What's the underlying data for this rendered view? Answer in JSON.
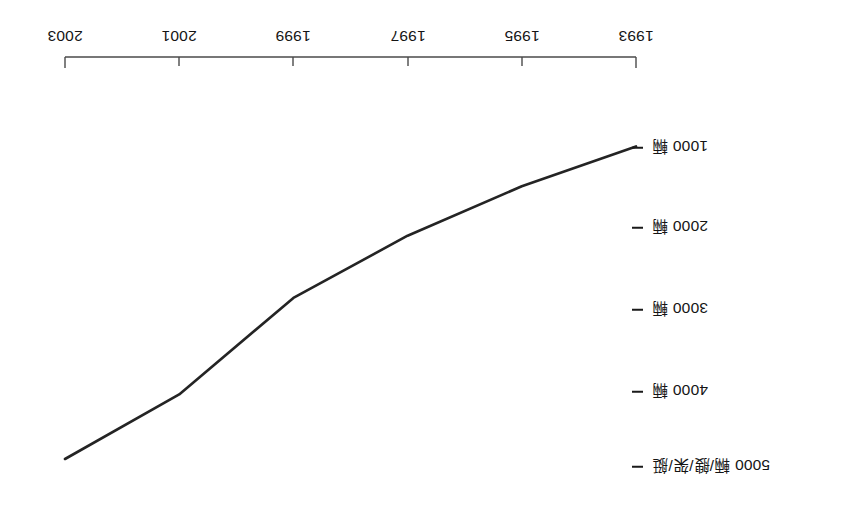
{
  "figure": {
    "orientation_note": "180",
    "line_color": "#242424",
    "axis_color": "#4a4a4a"
  },
  "chart_data": {
    "type": "line",
    "title": "",
    "subtitle": "",
    "xlabel": "",
    "ylabel": "5000 輛/艘/架/艇",
    "grid": false,
    "legend": false,
    "x": [
      1993,
      1995,
      1997,
      1999,
      2001,
      2003
    ],
    "categories": [
      "1993",
      "1995",
      "1997",
      "1999",
      "2001",
      "2003"
    ],
    "xlim": [
      1993,
      2003
    ],
    "ylim": [
      0,
      5400
    ],
    "yticks": [
      1000,
      2000,
      3000,
      4000,
      5000
    ],
    "ytick_labels": [
      "1000 輛",
      "2000 輛",
      "3000 輛",
      "4000 輛",
      "5000 輛/艘/架/艇"
    ],
    "series": [
      {
        "name": "",
        "values": [
          980,
          1480,
          2100,
          2880,
          4090,
          4900
        ]
      }
    ]
  },
  "axes": {
    "x_ticks": [
      {
        "label": "1993",
        "value": 1993
      },
      {
        "label": "1995",
        "value": 1995
      },
      {
        "label": "1997",
        "value": 1997
      },
      {
        "label": "1999",
        "value": 1999
      },
      {
        "label": "2001",
        "value": 2001
      },
      {
        "label": "2003",
        "value": 2003
      }
    ],
    "y_ticks": [
      {
        "label": "1000 輛",
        "value": 1000
      },
      {
        "label": "2000 輛",
        "value": 2000
      },
      {
        "label": "3000 輛",
        "value": 3000
      },
      {
        "label": "4000 輛",
        "value": 4000
      },
      {
        "label": "5000 輛/艘/架/艇",
        "value": 5000
      }
    ]
  }
}
